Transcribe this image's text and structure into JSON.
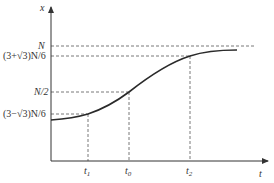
{
  "diagram": {
    "type": "logistic-growth-curve",
    "axes": {
      "y_label": "x",
      "x_label": "t"
    },
    "y_levels": [
      {
        "id": "N",
        "label": "N",
        "y": 46
      },
      {
        "id": "upper",
        "label": "(3+√3)N/6",
        "y": 56
      },
      {
        "id": "half",
        "label": "N/2",
        "y": 92
      },
      {
        "id": "lower",
        "label": "(3−√3)N/6",
        "y": 114
      }
    ],
    "x_marks": [
      {
        "id": "t1",
        "base": "t",
        "sub": "1",
        "x": 88
      },
      {
        "id": "t0",
        "base": "t",
        "sub": "0",
        "x": 129
      },
      {
        "id": "t2",
        "base": "t",
        "sub": "2",
        "x": 190
      }
    ],
    "colors": {
      "curve": "#2a2a2a",
      "axis": "#333333",
      "dashed": "#555555",
      "text": "#333333"
    }
  }
}
